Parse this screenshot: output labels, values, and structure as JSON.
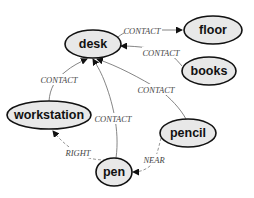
{
  "diagram": {
    "type": "scene-graph",
    "nodes": [
      {
        "id": "desk",
        "label": "desk"
      },
      {
        "id": "floor",
        "label": "floor"
      },
      {
        "id": "books",
        "label": "books"
      },
      {
        "id": "workstation",
        "label": "workstation"
      },
      {
        "id": "pencil",
        "label": "pencil"
      },
      {
        "id": "pen",
        "label": "pen"
      }
    ],
    "edges": [
      {
        "from": "desk",
        "to": "floor",
        "label": "CONTACT",
        "style": "solid"
      },
      {
        "from": "books",
        "to": "desk",
        "label": "CONTACT",
        "style": "solid"
      },
      {
        "from": "workstation",
        "to": "desk",
        "label": "CONTACT",
        "style": "solid"
      },
      {
        "from": "pencil",
        "to": "desk",
        "label": "CONTACT",
        "style": "solid"
      },
      {
        "from": "pen",
        "to": "desk",
        "label": "CONTACT",
        "style": "solid"
      },
      {
        "from": "pen",
        "to": "workstation",
        "label": "RIGHT",
        "style": "dashed"
      },
      {
        "from": "pencil",
        "to": "pen",
        "label": "NEAR",
        "style": "dashed"
      }
    ]
  },
  "colors": {
    "node_fill": "#e8e8e8",
    "node_stroke": "#111111",
    "edge": "#777777",
    "edge_label": "#444444"
  }
}
